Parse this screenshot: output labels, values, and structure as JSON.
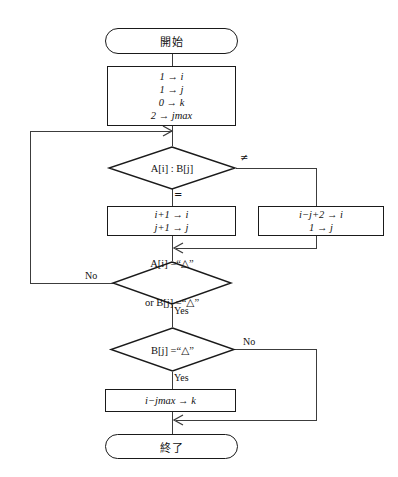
{
  "diagram": {
    "title_lang": "ja",
    "line_color": "#3c3c3c",
    "shape_border_color": "#1a1a1a",
    "background": "#ffffff",
    "nodes": {
      "start": {
        "type": "terminal",
        "label": "開始"
      },
      "init": {
        "type": "process",
        "lines": [
          "1 → i",
          "1 → j",
          "0 → k",
          "2 → jmax"
        ]
      },
      "compare": {
        "type": "decision",
        "lines": [
          "A[i] : B[j]"
        ],
        "branch_equal": "=",
        "branch_not_equal": "≠"
      },
      "advance": {
        "type": "process",
        "lines": [
          "i+1 → i",
          "j+1 → j"
        ]
      },
      "reset": {
        "type": "process",
        "lines": [
          "i−j+2 → i",
          "1 → j"
        ]
      },
      "check_triangle_either": {
        "type": "decision",
        "lines": [
          "A[i] =“△”",
          "or B[j] =“△”"
        ],
        "branch_no": "No",
        "branch_yes": "Yes"
      },
      "check_triangle_b": {
        "type": "decision",
        "lines": [
          "B[j] =“△”"
        ],
        "branch_no": "No",
        "branch_yes": "Yes"
      },
      "result": {
        "type": "process",
        "lines": [
          "i−jmax → k"
        ]
      },
      "end": {
        "type": "terminal",
        "label": "終了"
      }
    }
  }
}
